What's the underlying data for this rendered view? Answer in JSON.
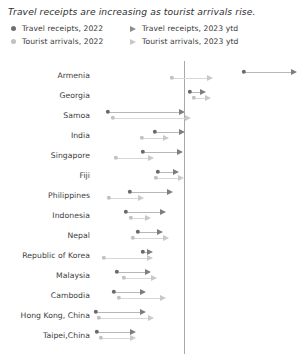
{
  "chart": {
    "title": "Travel receipts are increasing as tourist arrivals rise.",
    "legend": [
      {
        "label": "Travel receipts, 2022",
        "marker": "circle-dot-icon",
        "tone": "dark"
      },
      {
        "label": "Tourist arrivals, 2022",
        "marker": "circle-dot-icon",
        "tone": "light"
      },
      {
        "label": "Travel receipts, 2023 ytd",
        "marker": "arrow-right-icon",
        "tone": "dark"
      },
      {
        "label": "Tourist arrivals, 2023 ytd",
        "marker": "arrow-right-icon",
        "tone": "light"
      }
    ]
  },
  "colors": {
    "receipts_2022": "#6a6a6a",
    "arrivals_2022": "#c2c2c2",
    "receipts_2023": "#7e7e7e",
    "arrivals_2023": "#c9c9c9",
    "axis": "#a9a9a9",
    "connector_dark": "#b8b8b8",
    "connector_light": "#d8d8d8",
    "text": "#3b3b3b",
    "background": "#ffffff"
  },
  "chart_data": {
    "type": "scatter",
    "title": "Travel receipts are increasing as tourist arrivals rise.",
    "xlabel": "",
    "ylabel": "",
    "grid": false,
    "legend_position": "top-left",
    "axis_reference_value": 0,
    "x_axis_pixel_of_reference": 184,
    "note": "Dumbbell / arrow chart: each economy has a 2022 dot and a 2023-ytd arrowhead for both travel receipts (dark) and tourist arrivals (light). Values read off pixel positions relative to the vertical reference line.",
    "categories": [
      "Armenia",
      "Georgia",
      "Samoa",
      "India",
      "Singapore",
      "Fiji",
      "Philippines",
      "Indonesia",
      "Nepal",
      "Republic of Korea",
      "Malaysia",
      "Cambodia",
      "Hong Kong, China",
      "Taipei,China"
    ],
    "series": [
      {
        "name": "Travel receipts, 2022",
        "marker": "circle",
        "tone": "dark",
        "values_px": [
          244,
          190,
          108,
          155,
          143,
          158,
          130,
          126,
          138,
          143,
          117,
          114,
          96,
          97
        ]
      },
      {
        "name": "Tourist arrivals, 2022",
        "marker": "circle",
        "tone": "light",
        "values_px": [
          172,
          194,
          113,
          142,
          116,
          156,
          109,
          131,
          133,
          104,
          124,
          119,
          99,
          101
        ]
      },
      {
        "name": "Travel receipts, 2023 ytd",
        "marker": "arrow",
        "tone": "dark",
        "values_px": [
          297,
          206,
          185,
          185,
          183,
          179,
          173,
          166,
          163,
          153,
          151,
          146,
          146,
          136
        ]
      },
      {
        "name": "Tourist arrivals, 2023 ytd",
        "marker": "arrow",
        "tone": "light",
        "values_px": [
          213,
          211,
          191,
          169,
          154,
          184,
          144,
          151,
          169,
          153,
          157,
          166,
          154,
          136
        ]
      }
    ],
    "row_y_px": [
      75,
      95,
      115,
      135,
      155,
      175,
      195,
      215,
      235,
      255,
      275,
      295,
      315,
      335
    ]
  }
}
